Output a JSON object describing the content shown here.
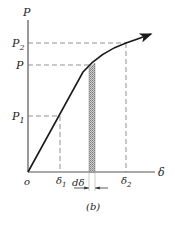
{
  "figure": {
    "caption": "(b)",
    "y_axis_label": "P",
    "x_axis_label": "δ",
    "origin_label": "o",
    "y_ticks": [
      {
        "label": "P",
        "sub": "2",
        "y": 43
      },
      {
        "label": "P",
        "sub": "",
        "y": 65
      },
      {
        "label": "P",
        "sub": "1",
        "y": 116
      }
    ],
    "x_ticks": [
      {
        "label": "δ",
        "sub": "1",
        "x": 60
      },
      {
        "label": "δ",
        "sub": "2",
        "x": 126
      }
    ],
    "strip_label": "dδ",
    "colors": {
      "curve": "#1a1a1a",
      "axis": "#555555",
      "dash": "#777777",
      "hatch": "#888888"
    }
  },
  "labels": {
    "P_axis": "P",
    "P2_main": "P",
    "P2_sub": "2",
    "P_mid": "P",
    "P1_main": "P",
    "P1_sub": "1",
    "origin": "o",
    "d1_main": "δ",
    "d1_sub": "1",
    "d2_main": "δ",
    "d2_sub": "2",
    "delta_axis": "δ",
    "d_delta": "dδ",
    "caption": "(b)"
  }
}
